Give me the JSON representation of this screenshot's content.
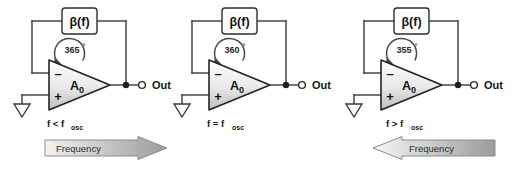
{
  "figure": {
    "background_color": "#ffffff",
    "wire_color": "#3a3a3a"
  },
  "circuits": [
    {
      "id": "below-resonance",
      "feedback_block_label": "β(f)",
      "phase_label": "365",
      "degree_symbol": "°",
      "amplifier_label": "A",
      "amplifier_subscript": "0",
      "inverting_sign": "–",
      "noninverting_sign": "+",
      "output_label": "Out",
      "condition_main": "f < f",
      "condition_subscript": "osc",
      "ground_icon": "ground-symbol",
      "output_node_icon": "junction-dot",
      "output_terminal_icon": "open-terminal"
    },
    {
      "id": "at-resonance",
      "feedback_block_label": "β(f)",
      "phase_label": "360",
      "degree_symbol": "°",
      "amplifier_label": "A",
      "amplifier_subscript": "0",
      "inverting_sign": "–",
      "noninverting_sign": "+",
      "output_label": "Out",
      "condition_main": "f = f",
      "condition_subscript": "osc",
      "ground_icon": "ground-symbol",
      "output_node_icon": "junction-dot",
      "output_terminal_icon": "open-terminal"
    },
    {
      "id": "above-resonance",
      "feedback_block_label": "β(f)",
      "phase_label": "355",
      "degree_symbol": "°",
      "amplifier_label": "A",
      "amplifier_subscript": "0",
      "inverting_sign": "–",
      "noninverting_sign": "+",
      "output_label": "Out",
      "condition_main": "f > f",
      "condition_subscript": "osc",
      "ground_icon": "ground-symbol",
      "output_node_icon": "junction-dot",
      "output_terminal_icon": "open-terminal"
    }
  ],
  "banners": [
    {
      "id": "frequency-increasing",
      "label": "Frequency",
      "direction": "right",
      "fill_light": "#f2f2f2",
      "fill_dark": "#9b9b9b"
    },
    {
      "id": "frequency-decreasing",
      "label": "Frequency",
      "direction": "left",
      "fill_light": "#f2f2f2",
      "fill_dark": "#9b9b9b"
    }
  ]
}
